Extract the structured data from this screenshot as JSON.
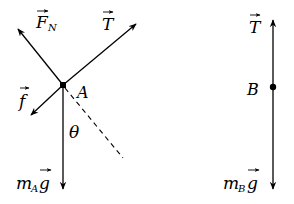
{
  "diagram": {
    "type": "free-body-diagram",
    "left_body": {
      "point_label": "A",
      "forces": [
        {
          "id": "normal",
          "symbol": "F",
          "subscript": "N",
          "direction": "up-left"
        },
        {
          "id": "tension",
          "symbol": "T",
          "subscript": "",
          "direction": "up-right"
        },
        {
          "id": "friction",
          "symbol": "f",
          "subscript": "",
          "direction": "down-left"
        },
        {
          "id": "weight",
          "symbol": "m",
          "subscript": "A",
          "vector": "g",
          "direction": "down"
        }
      ],
      "angle_label": "θ"
    },
    "right_body": {
      "point_label": "B",
      "forces": [
        {
          "id": "tension",
          "symbol": "T",
          "subscript": "",
          "direction": "up"
        },
        {
          "id": "weight",
          "symbol": "m",
          "subscript": "B",
          "vector": "g",
          "direction": "down"
        }
      ]
    }
  }
}
